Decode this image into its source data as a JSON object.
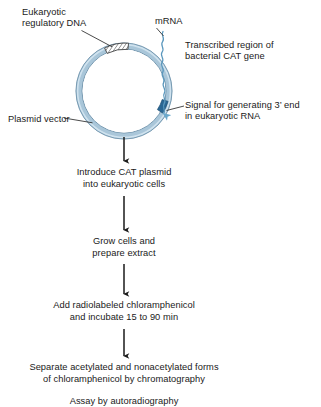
{
  "figure": {
    "type": "biology-flow-diagram",
    "background": "#ffffff",
    "text_color": "#1a1a1a"
  },
  "plasmid": {
    "name": "CAT plasmid",
    "ring_color": "#a9c6d9",
    "ring_edge_color": "#6f93ab",
    "highlight_color": "#d9e8f2",
    "center": {
      "x": 124,
      "y": 91
    },
    "radius": 45,
    "segments": [
      {
        "id": "eukaryotic-regulatory-dna",
        "label": "Eukaryotic regulatory DNA",
        "style": "hatched",
        "fill": "#ffffff",
        "stroke": "#3b3b3b",
        "position": "top"
      },
      {
        "id": "signal-3-prime-end",
        "label": "Signal for generating 3' end in eukaryotic RNA",
        "style": "solid",
        "fill": "#2f6f9e",
        "position": "right"
      }
    ],
    "mrna": {
      "label": "mRNA",
      "style": "wavy-line",
      "color": "#5a97bd",
      "arrow_color": "#6aa8cb"
    }
  },
  "labels": {
    "eukaryotic_regulatory_dna": "Eukaryotic\nregulatory DNA",
    "mrna": "mRNA",
    "transcribed_region": "Transcribed region of\nbacterial CAT gene",
    "plasmid_vector": "Plasmid vector",
    "signal_3_end": "Signal for generating 3’ end\nin eukaryotic RNA"
  },
  "flow": {
    "arrow_color": "#1a1a1a",
    "steps": [
      {
        "id": "step-introduce",
        "text": "Introduce CAT plasmid\ninto eukaryotic cells"
      },
      {
        "id": "step-grow",
        "text": "Grow cells and\nprepare extract"
      },
      {
        "id": "step-add",
        "text": "Add radiolabeled chloramphenicol\nand incubate 15 to 90 min"
      },
      {
        "id": "step-separate",
        "text": "Separate acetylated and nonacetylated forms\nof chloramphenicol by chromatography"
      },
      {
        "id": "step-assay",
        "text": "Assay by autoradiography"
      }
    ]
  }
}
